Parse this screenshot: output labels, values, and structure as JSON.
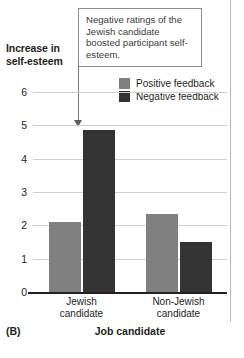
{
  "figure": {
    "panel_letter": "(B)",
    "y_axis_title_line1": "Increase in",
    "y_axis_title_line2": "self-esteem",
    "annotation": "Negative ratings of the Jewish candidate boosted participant self-esteem."
  },
  "colors": {
    "positive_feedback": "#808080",
    "negative_feedback": "#333333",
    "gridline": "#cfcfcf",
    "axis": "#231f20",
    "callout_border": "#8d8d8d",
    "pointer": "#5e5e5e"
  },
  "chart_data": {
    "type": "bar",
    "title": "",
    "xlabel": "Job candidate",
    "ylabel": "Increase in self-esteem",
    "categories": [
      "Jewish candidate",
      "Non-Jewish candidate"
    ],
    "category_lines": [
      [
        "Jewish",
        "candidate"
      ],
      [
        "Non-Jewish",
        "candidate"
      ]
    ],
    "series": [
      {
        "name": "Positive feedback",
        "values": [
          2.1,
          2.35
        ],
        "color": "#808080"
      },
      {
        "name": "Negative feedback",
        "values": [
          4.85,
          1.5
        ],
        "color": "#333333"
      }
    ],
    "ylim": [
      0,
      6
    ],
    "yticks": [
      0,
      1,
      2,
      3,
      4,
      5,
      6
    ],
    "ytick_labels": [
      "0",
      "1",
      "2",
      "3",
      "4",
      "5",
      "6"
    ],
    "grid": true,
    "legend_position": "top-right",
    "annotations": [
      {
        "text": "Negative ratings of the Jewish candidate boosted participant self-esteem.",
        "points_to": {
          "category": "Jewish candidate",
          "series": "Negative feedback"
        }
      }
    ]
  }
}
